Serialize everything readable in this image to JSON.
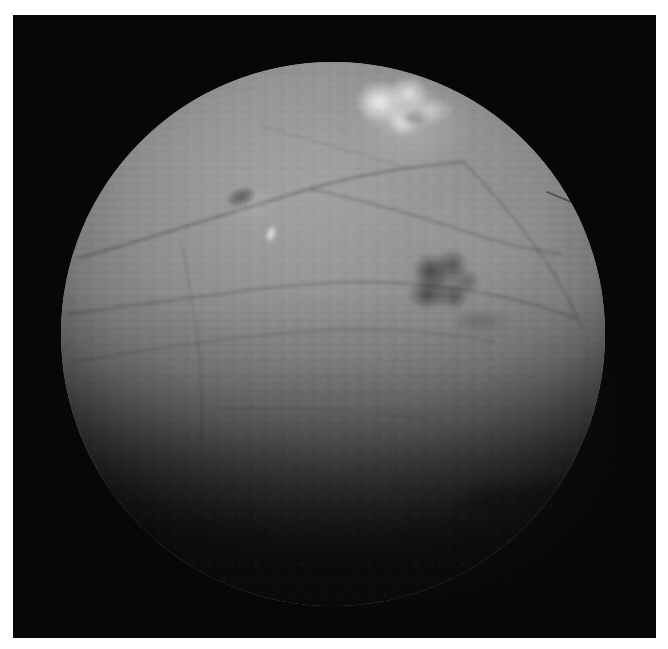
{
  "image": {
    "kind": "fundus-photograph",
    "modality_label": "retinal fundus photograph",
    "color_mode": "grayscale",
    "width_px": 668,
    "height_px": 649,
    "page_background": "#ffffff",
    "field_background": "#070707",
    "visible_text": ""
  },
  "photo_field": {
    "left_px": 13,
    "top_px": 15,
    "width_px": 643,
    "height_px": 623
  },
  "fundus_disc": {
    "center_x_px": 333,
    "center_y_px": 334,
    "radius_px": 272,
    "base_color": "#8d8d8d",
    "brightest_color": "#9b9b9b",
    "darkest_color": "#1b1b1b",
    "illumination": "bright upper-middle fading to heavy vignette at the bottom"
  },
  "features": [
    {
      "id": "exudate-main",
      "name": "bright exudate cluster",
      "tone": "bright",
      "color": "#f2f2f2",
      "center_x_px": 403,
      "center_y_px": 112,
      "width_px": 100,
      "height_px": 72
    },
    {
      "id": "hemorrhage-main",
      "name": "dark haemorrhage blot",
      "tone": "dark",
      "color": "#4d4d4d",
      "center_x_px": 444,
      "center_y_px": 286,
      "width_px": 84,
      "height_px": 76
    },
    {
      "id": "microaneurysm",
      "name": "small dark microaneurysm",
      "tone": "dark",
      "color": "#5a5a5a",
      "center_x_px": 241,
      "center_y_px": 197,
      "width_px": 30,
      "height_px": 18
    },
    {
      "id": "drusen-dot",
      "name": "small bright drusen dot",
      "tone": "bright",
      "color": "#e8e8e8",
      "center_x_px": 271,
      "center_y_px": 234,
      "width_px": 12,
      "height_px": 20
    },
    {
      "id": "dark-patch-lower",
      "name": "faint dark patch lower right",
      "tone": "dark",
      "color": "#2a2a2a",
      "center_x_px": 512,
      "center_y_px": 498,
      "width_px": 130,
      "height_px": 62
    }
  ],
  "vessels": [
    {
      "id": "arcade-upper",
      "name": "upper vessel arcade",
      "path": "M 18 196 C 90 176 170 150 252 126 C 300 112 352 104 404 100",
      "stroke": "rgba(0,0,0,0.20)",
      "width_px": 3.2
    },
    {
      "id": "arcade-upper-branch",
      "name": "upper arcade branch",
      "path": "M 250 127 C 300 138 352 152 400 168 C 436 180 470 188 500 192",
      "stroke": "rgba(0,0,0,0.17)",
      "width_px": 2.6
    },
    {
      "id": "arcade-mid",
      "name": "mid horizontal vessel",
      "path": "M 6 252 C 70 244 140 234 206 226 C 268 219 330 218 390 226 C 436 232 476 242 514 256",
      "stroke": "rgba(0,0,0,0.16)",
      "width_px": 3.0
    },
    {
      "id": "arcade-mid-lower",
      "name": "lower mid vessel",
      "path": "M 12 300 C 84 288 160 276 236 270 C 306 265 372 268 432 280",
      "stroke": "rgba(0,0,0,0.13)",
      "width_px": 2.4
    },
    {
      "id": "vessel-descending-left",
      "name": "descending left vessel",
      "path": "M 120 180 C 128 216 134 254 138 292 C 141 322 142 350 140 378",
      "stroke": "rgba(0,0,0,0.11)",
      "width_px": 2.2
    },
    {
      "id": "vessel-diagonal-right",
      "name": "diagonal right vessel",
      "path": "M 404 102 C 436 134 462 166 484 198 C 500 222 512 244 520 264",
      "stroke": "rgba(0,0,0,0.15)",
      "width_px": 2.6
    },
    {
      "id": "vessel-rim-right",
      "name": "thin vessel near right rim",
      "path": "M 486 130 C 506 138 524 146 540 154",
      "stroke": "rgba(0,0,0,0.46)",
      "width_px": 1.6
    },
    {
      "id": "vessel-thin-upper",
      "name": "thin upper vessel",
      "path": "M 200 64 C 250 78 300 92 348 106",
      "stroke": "rgba(0,0,0,0.10)",
      "width_px": 1.8
    },
    {
      "id": "vessel-lower-faint",
      "name": "faint lower vessel",
      "path": "M 160 346 C 230 344 300 348 366 358",
      "stroke": "rgba(0,0,0,0.07)",
      "width_px": 2.0
    }
  ]
}
